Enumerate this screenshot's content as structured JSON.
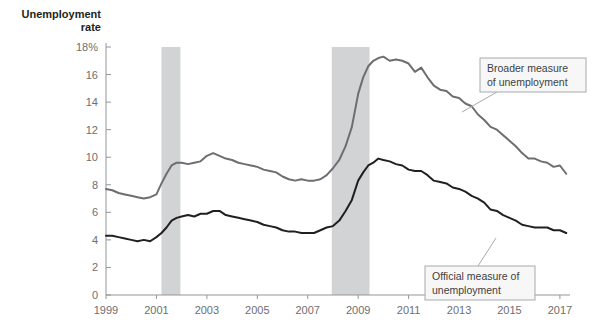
{
  "chart_data": {
    "type": "line",
    "title": "",
    "ylabel": "Unemployment rate",
    "xlabel": "",
    "xlim": [
      1999,
      2017.4
    ],
    "ylim": [
      0,
      18
    ],
    "grid": false,
    "legend_position": "inline-callouts",
    "y_ticks": [
      "0",
      "2",
      "4",
      "6",
      "8",
      "10",
      "12",
      "14",
      "16",
      "18%"
    ],
    "y_tick_values": [
      0,
      2,
      4,
      6,
      8,
      10,
      12,
      14,
      16,
      18
    ],
    "x_ticks": [
      "1999",
      "2001",
      "2003",
      "2005",
      "2007",
      "2009",
      "2011",
      "2013",
      "2015",
      "2017"
    ],
    "x_tick_values": [
      1999,
      2001,
      2003,
      2005,
      2007,
      2009,
      2011,
      2013,
      2015,
      2017
    ],
    "shaded_regions": [
      {
        "name": "recession-2001",
        "x0": 2001.2,
        "x1": 2001.95,
        "color": "#d1d3d4"
      },
      {
        "name": "recession-2008",
        "x0": 2007.95,
        "x1": 2009.45,
        "color": "#d1d3d4"
      }
    ],
    "series": [
      {
        "name": "Broader measure of unemployment",
        "color": "#6d6e71",
        "width": 2,
        "x": [
          1999.0,
          1999.25,
          1999.5,
          1999.75,
          2000.0,
          2000.25,
          2000.5,
          2000.75,
          2001.0,
          2001.2,
          2001.4,
          2001.6,
          2001.8,
          2002.0,
          2002.25,
          2002.5,
          2002.75,
          2003.0,
          2003.25,
          2003.5,
          2003.75,
          2004.0,
          2004.25,
          2004.5,
          2004.75,
          2005.0,
          2005.25,
          2005.5,
          2005.75,
          2006.0,
          2006.25,
          2006.5,
          2006.75,
          2007.0,
          2007.25,
          2007.5,
          2007.75,
          2008.0,
          2008.25,
          2008.5,
          2008.75,
          2009.0,
          2009.2,
          2009.4,
          2009.6,
          2009.8,
          2010.0,
          2010.25,
          2010.5,
          2010.75,
          2011.0,
          2011.25,
          2011.5,
          2011.75,
          2012.0,
          2012.25,
          2012.5,
          2012.75,
          2013.0,
          2013.25,
          2013.5,
          2013.75,
          2014.0,
          2014.25,
          2014.5,
          2014.75,
          2015.0,
          2015.25,
          2015.5,
          2015.75,
          2016.0,
          2016.25,
          2016.5,
          2016.75,
          2017.0,
          2017.25
        ],
        "y": [
          7.7,
          7.6,
          7.4,
          7.3,
          7.2,
          7.1,
          7.0,
          7.1,
          7.3,
          8.1,
          8.8,
          9.4,
          9.6,
          9.6,
          9.5,
          9.6,
          9.7,
          10.1,
          10.3,
          10.1,
          9.9,
          9.8,
          9.6,
          9.5,
          9.4,
          9.3,
          9.1,
          9.0,
          8.9,
          8.6,
          8.4,
          8.3,
          8.4,
          8.3,
          8.3,
          8.4,
          8.7,
          9.2,
          9.8,
          10.8,
          12.2,
          14.6,
          15.8,
          16.6,
          17.0,
          17.2,
          17.3,
          17.0,
          17.1,
          17.0,
          16.8,
          16.2,
          16.5,
          15.8,
          15.2,
          14.9,
          14.8,
          14.4,
          14.3,
          13.9,
          13.7,
          13.1,
          12.7,
          12.2,
          12.0,
          11.6,
          11.2,
          10.8,
          10.3,
          9.9,
          9.9,
          9.7,
          9.6,
          9.3,
          9.4,
          8.8
        ]
      },
      {
        "name": "Official measure of unemployment",
        "color": "#231f20",
        "width": 2,
        "x": [
          1999.0,
          1999.25,
          1999.5,
          1999.75,
          2000.0,
          2000.25,
          2000.5,
          2000.75,
          2001.0,
          2001.2,
          2001.4,
          2001.6,
          2001.8,
          2002.0,
          2002.25,
          2002.5,
          2002.75,
          2003.0,
          2003.25,
          2003.5,
          2003.75,
          2004.0,
          2004.25,
          2004.5,
          2004.75,
          2005.0,
          2005.25,
          2005.5,
          2005.75,
          2006.0,
          2006.25,
          2006.5,
          2006.75,
          2007.0,
          2007.25,
          2007.5,
          2007.75,
          2008.0,
          2008.25,
          2008.5,
          2008.75,
          2009.0,
          2009.2,
          2009.4,
          2009.6,
          2009.8,
          2010.0,
          2010.25,
          2010.5,
          2010.75,
          2011.0,
          2011.25,
          2011.5,
          2011.75,
          2012.0,
          2012.25,
          2012.5,
          2012.75,
          2013.0,
          2013.25,
          2013.5,
          2013.75,
          2014.0,
          2014.25,
          2014.5,
          2014.75,
          2015.0,
          2015.25,
          2015.5,
          2015.75,
          2016.0,
          2016.25,
          2016.5,
          2016.75,
          2017.0,
          2017.25
        ],
        "y": [
          4.3,
          4.3,
          4.2,
          4.1,
          4.0,
          3.9,
          4.0,
          3.9,
          4.2,
          4.5,
          4.9,
          5.4,
          5.6,
          5.7,
          5.8,
          5.7,
          5.9,
          5.9,
          6.1,
          6.1,
          5.8,
          5.7,
          5.6,
          5.5,
          5.4,
          5.3,
          5.1,
          5.0,
          4.9,
          4.7,
          4.6,
          4.6,
          4.5,
          4.5,
          4.5,
          4.7,
          4.9,
          5.0,
          5.4,
          6.1,
          6.9,
          8.3,
          8.9,
          9.4,
          9.6,
          9.9,
          9.8,
          9.7,
          9.5,
          9.4,
          9.1,
          9.0,
          9.0,
          8.7,
          8.3,
          8.2,
          8.1,
          7.8,
          7.7,
          7.5,
          7.2,
          7.0,
          6.7,
          6.2,
          6.1,
          5.8,
          5.6,
          5.4,
          5.1,
          5.0,
          4.9,
          4.9,
          4.9,
          4.7,
          4.7,
          4.5
        ]
      }
    ],
    "annotations": [
      {
        "name": "broader-measure-callout",
        "text_lines": [
          "Broader measure",
          "of unemployment"
        ],
        "box": {
          "x": 480,
          "y": 58,
          "w": 106,
          "h": 34
        },
        "leader_from": {
          "x": 497,
          "y": 92
        },
        "leader_to": {
          "x": 462,
          "y": 112
        }
      },
      {
        "name": "official-measure-callout",
        "text_lines": [
          "Official measure of",
          "unemployment"
        ],
        "box": {
          "x": 425,
          "y": 266,
          "w": 110,
          "h": 34
        },
        "leader_from": {
          "x": 478,
          "y": 266
        },
        "leader_to": {
          "x": 496,
          "y": 238
        }
      }
    ]
  },
  "plot": {
    "left": 106,
    "right": 570,
    "top": 47,
    "bottom": 295,
    "axis_color": "#939598"
  },
  "labels": {
    "y_axis_title_line1": "Unemployment",
    "y_axis_title_line2": "rate"
  }
}
